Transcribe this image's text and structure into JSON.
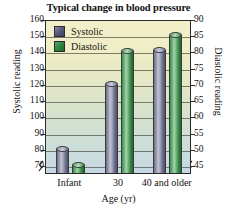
{
  "chart_data": {
    "type": "bar",
    "title": "Typical change in blood pressure",
    "xlabel": "Age (yr)",
    "ylabel": "Systolic reading",
    "y2label": "Diastolic reading",
    "categories": [
      "Infant",
      "30",
      "40 and older"
    ],
    "series": [
      {
        "name": "Systolic",
        "axis": "left",
        "color": "#5a5c7e",
        "values": [
          80,
          120,
          141
        ]
      },
      {
        "name": "Diastolic",
        "axis": "right",
        "color": "#2f8440",
        "values": [
          45,
          80,
          85
        ]
      }
    ],
    "ylim": [
      65,
      160
    ],
    "y2lim": [
      42.5,
      90
    ],
    "yticks": [
      70,
      80,
      90,
      100,
      110,
      120,
      130,
      140,
      150,
      160
    ],
    "y2ticks": [
      45,
      50,
      55,
      60,
      65,
      70,
      75,
      80,
      85,
      90
    ],
    "grid": true,
    "axis_break_left": true,
    "axis_break_right": true,
    "legend_position": "top-left"
  },
  "legend": {
    "items": [
      {
        "label": "Systolic"
      },
      {
        "label": "Diastolic"
      }
    ]
  }
}
